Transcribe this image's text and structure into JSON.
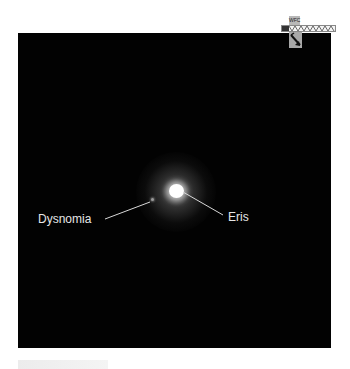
{
  "image": {
    "description": "Telescope image of dwarf planet Eris and its moon Dysnomia on a black background",
    "background_color": "#020202"
  },
  "labels": {
    "moon": "Dysnomia",
    "planet": "Eris"
  },
  "compass": {
    "tag_text": "WFC",
    "icon": "compass-arrow-icon"
  }
}
